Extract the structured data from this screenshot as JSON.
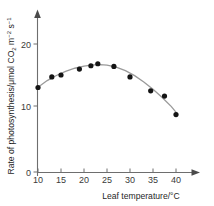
{
  "chart_data": {
    "type": "scatter",
    "title": "",
    "subtitle": "",
    "xlabel": "Leaf temperature/°C",
    "ylabel": "Rate of photosynthesis/μmol CO₂ m⁻² s⁻¹",
    "ylabel_parts": {
      "main": "Rate of photosynthesis/μmol CO",
      "co2_sub": "2",
      "space_m": " m",
      "m_sup": "−2",
      "space_s": " s",
      "s_sup": "−1"
    },
    "xlabel_parts": {
      "main": "Leaf temperature/",
      "degree": "°C"
    },
    "xlim": [
      10,
      44
    ],
    "ylim": [
      0,
      23
    ],
    "xticks": [
      10,
      15,
      20,
      25,
      30,
      35,
      40
    ],
    "xtick_labels": [
      "10",
      "15",
      "20",
      "25",
      "30",
      "35",
      "40"
    ],
    "yticks": [
      0,
      10,
      20
    ],
    "ytick_labels": [
      "0",
      "10",
      "20"
    ],
    "grid": false,
    "legend": null,
    "legend_position": "none",
    "marker_color": "#141414",
    "curve_color": "#9a9a9a",
    "axis_color": "#6e6e6e",
    "x": [
      10,
      13,
      15,
      19,
      21.5,
      23,
      26.5,
      30,
      34.5,
      37.5,
      40
    ],
    "values": [
      12.8,
      14.4,
      14.7,
      15.6,
      16.1,
      16.4,
      16.0,
      14.4,
      12.3,
      11.5,
      8.7
    ],
    "points": [
      {
        "x": 10,
        "y": 12.8
      },
      {
        "x": 13,
        "y": 14.4
      },
      {
        "x": 15,
        "y": 14.7
      },
      {
        "x": 19,
        "y": 15.6
      },
      {
        "x": 21.5,
        "y": 16.1
      },
      {
        "x": 23,
        "y": 16.4
      },
      {
        "x": 26.5,
        "y": 16.0
      },
      {
        "x": 30,
        "y": 14.4
      },
      {
        "x": 34.5,
        "y": 12.3
      },
      {
        "x": 37.5,
        "y": 11.5
      },
      {
        "x": 40,
        "y": 8.7
      }
    ],
    "fit_curve": [
      {
        "x": 10,
        "y": 12.85
      },
      {
        "x": 12,
        "y": 13.85
      },
      {
        "x": 14,
        "y": 14.62
      },
      {
        "x": 16,
        "y": 15.25
      },
      {
        "x": 18,
        "y": 15.72
      },
      {
        "x": 20,
        "y": 16.05
      },
      {
        "x": 22,
        "y": 16.22
      },
      {
        "x": 23.5,
        "y": 16.28
      },
      {
        "x": 25,
        "y": 16.2
      },
      {
        "x": 27,
        "y": 15.9
      },
      {
        "x": 29,
        "y": 15.35
      },
      {
        "x": 31,
        "y": 14.6
      },
      {
        "x": 33,
        "y": 13.65
      },
      {
        "x": 35,
        "y": 12.55
      },
      {
        "x": 37,
        "y": 11.3
      },
      {
        "x": 39,
        "y": 9.9
      },
      {
        "x": 40.3,
        "y": 8.8
      }
    ]
  }
}
